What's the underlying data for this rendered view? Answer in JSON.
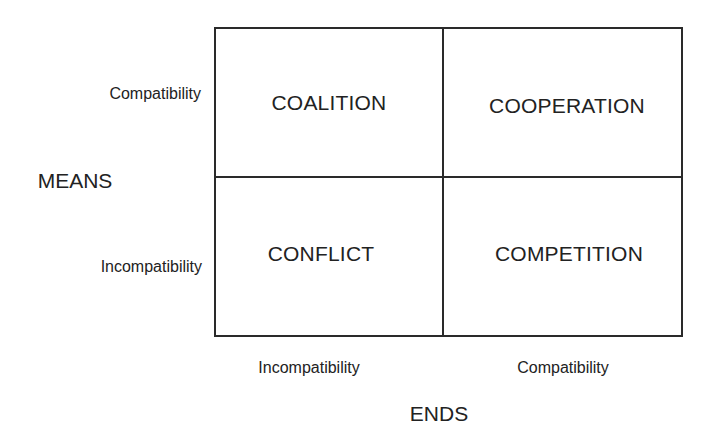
{
  "diagram": {
    "type": "2x2-matrix",
    "quadrants": {
      "top_left": "COALITION",
      "top_right": "COOPERATION",
      "bottom_left": "CONFLICT",
      "bottom_right": "COMPETITION"
    },
    "y_axis": {
      "title": "MEANS",
      "ticks": {
        "top": "Compatibility",
        "bottom": "Incompatibility"
      }
    },
    "x_axis": {
      "title": "ENDS",
      "ticks": {
        "left": "Incompatibility",
        "right": "Compatibility"
      }
    },
    "colors": {
      "line": "#2a2a2a",
      "text": "#222222",
      "background": "#ffffff"
    }
  }
}
